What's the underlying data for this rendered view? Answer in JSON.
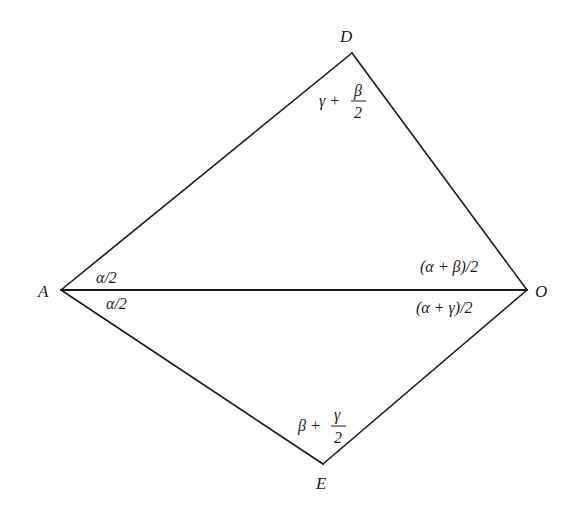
{
  "diagram": {
    "title": "",
    "colors": {
      "stroke": "#1a1a1a",
      "background": "#ffffff"
    },
    "vertices": [
      {
        "id": "A",
        "label": "A",
        "x": 61,
        "y": 290
      },
      {
        "id": "O",
        "label": "O",
        "x": 527,
        "y": 290
      },
      {
        "id": "D",
        "label": "D",
        "x": 352,
        "y": 53
      },
      {
        "id": "E",
        "label": "E",
        "x": 323,
        "y": 464
      }
    ],
    "segments": [
      {
        "from": "A",
        "to": "D"
      },
      {
        "from": "D",
        "to": "O"
      },
      {
        "from": "A",
        "to": "O"
      },
      {
        "from": "A",
        "to": "E"
      },
      {
        "from": "E",
        "to": "O"
      }
    ],
    "labels": {
      "A": "A",
      "O": "O",
      "D": "D",
      "E": "E"
    },
    "angles": {
      "A_upper": "α/2",
      "A_lower": "α/2",
      "O_upper": "(α + β)/2",
      "O_lower": "(α + γ)/2",
      "D": {
        "prefix": "γ +",
        "numerator": "β",
        "denominator": "2"
      },
      "E": {
        "prefix": "β +",
        "numerator": "γ",
        "denominator": "2"
      }
    }
  }
}
